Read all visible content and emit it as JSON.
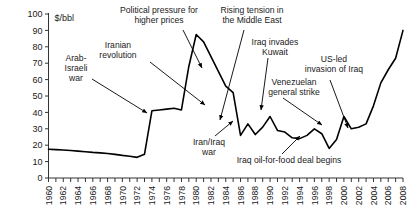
{
  "chart_data": {
    "type": "line",
    "title": "",
    "subtitle": "",
    "xlabel": "",
    "ylabel": "$/bbl",
    "unit_label": "$/bbl",
    "xlim": [
      1960,
      2008
    ],
    "ylim": [
      0,
      100
    ],
    "ytick_step": 10,
    "xtick_step": 1,
    "xlabel_step": 2,
    "grid": false,
    "legend": "none",
    "line_color": "#000000",
    "yticks": [
      0,
      10,
      20,
      30,
      40,
      50,
      60,
      70,
      80,
      90,
      100
    ],
    "xticklabels": [
      "1960",
      "1962",
      "1964",
      "1966",
      "1968",
      "1970",
      "1972",
      "1974",
      "1976",
      "1978",
      "1980",
      "1982",
      "1984",
      "1986",
      "1988",
      "1990",
      "1992",
      "1994",
      "1996",
      "1998",
      "2000",
      "2002",
      "2004",
      "2006",
      "2008"
    ],
    "x": [
      1960,
      1961,
      1962,
      1963,
      1964,
      1965,
      1966,
      1967,
      1968,
      1969,
      1970,
      1971,
      1972,
      1973,
      1974,
      1975,
      1976,
      1977,
      1978,
      1979,
      1980,
      1981,
      1982,
      1983,
      1984,
      1985,
      1986,
      1987,
      1988,
      1989,
      1990,
      1991,
      1992,
      1993,
      1994,
      1995,
      1996,
      1997,
      1998,
      1999,
      2000,
      2001,
      2002,
      2003,
      2004,
      2005,
      2006,
      2007,
      2008
    ],
    "values": [
      17.5,
      17.3,
      17.1,
      16.8,
      16.4,
      16.0,
      15.6,
      15.3,
      14.9,
      14.4,
      13.8,
      13.3,
      12.6,
      14.5,
      41.0,
      41.5,
      42.0,
      42.5,
      41.5,
      68.0,
      87.5,
      83.0,
      74.0,
      65.0,
      56.0,
      52.0,
      26.0,
      33.0,
      26.5,
      31.0,
      37.5,
      29.0,
      28.0,
      24.5,
      24.0,
      26.0,
      30.0,
      27.0,
      18.0,
      23.5,
      37.5,
      30.0,
      31.0,
      33.0,
      44.0,
      58.0,
      66.0,
      73.0,
      90.0
    ],
    "series_name": "Crude oil price",
    "annotations": [
      {
        "id": "arab-israeli-war",
        "text": "Arab-\nIsraeli\nwar",
        "lines": [
          "Arab-",
          "Israeli",
          "war"
        ]
      },
      {
        "id": "iranian-revolution",
        "text": "Iranian\nrevolution",
        "lines": [
          "Iranian",
          "revolution"
        ]
      },
      {
        "id": "political-pressure",
        "text": "Political pressure for\nhigher prices",
        "lines": [
          "Political pressure for",
          "higher prices"
        ]
      },
      {
        "id": "rising-tension-middle-east",
        "text": "Rising tension in\nthe Middle East",
        "lines": [
          "Rising tension in",
          "the Middle East"
        ]
      },
      {
        "id": "iran-iraq-war",
        "text": "Iran/Iraq\nwar",
        "lines": [
          "Iran/Iraq",
          "war"
        ]
      },
      {
        "id": "iraq-invades-kuwait",
        "text": "Iraq invades\nKuwait",
        "lines": [
          "Iraq invades",
          "Kuwait"
        ]
      },
      {
        "id": "oil-for-food",
        "text": "Iraq oil-for-food deal begins",
        "lines": [
          "Iraq oil-for-food deal begins"
        ]
      },
      {
        "id": "venezuelan-general-strike",
        "text": "Venezuelan\ngeneral strike",
        "lines": [
          "Venezuelan",
          "general strike"
        ]
      },
      {
        "id": "us-led-invasion-iraq",
        "text": "US-led\ninvasion of Iraq",
        "lines": [
          "US-led",
          "invasion of Iraq"
        ]
      }
    ]
  },
  "annotations_text": {
    "arab_israeli_war_l1": "Arab-",
    "arab_israeli_war_l2": "Israeli",
    "arab_israeli_war_l3": "war",
    "iranian_revolution_l1": "Iranian",
    "iranian_revolution_l2": "revolution",
    "political_pressure_l1": "Political pressure for",
    "political_pressure_l2": "higher prices",
    "rising_tension_l1": "Rising tension in",
    "rising_tension_l2": "the Middle East",
    "iran_iraq_war_l1": "Iran/Iraq",
    "iran_iraq_war_l2": "war",
    "iraq_invades_kuwait_l1": "Iraq invades",
    "iraq_invades_kuwait_l2": "Kuwait",
    "oil_for_food_l1": "Iraq oil-for-food deal begins",
    "venezuelan_strike_l1": "Venezuelan",
    "venezuelan_strike_l2": "general strike",
    "us_led_invasion_l1": "US-led",
    "us_led_invasion_l2": "invasion of Iraq"
  },
  "axis": {
    "unit": "$/bbl",
    "y0": "0",
    "y10": "10",
    "y20": "20",
    "y30": "30",
    "y40": "40",
    "y50": "50",
    "y60": "60",
    "y70": "70",
    "y80": "80",
    "y90": "90",
    "y100": "100"
  }
}
